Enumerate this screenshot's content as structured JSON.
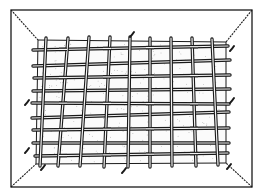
{
  "illustration": {
    "subject": "box-frame-with-woven-sticks",
    "colors": {
      "background": "#ffffff",
      "ink": "#1a1a1a",
      "stick_fill": "#f4f4f4",
      "speckle": "#9a9a9a"
    },
    "outer_frame": {
      "x1": 11,
      "y1": 10,
      "x2": 252,
      "y2": 187
    },
    "inner_frame": {
      "tl": [
        38,
        40
      ],
      "tr": [
        226,
        42
      ],
      "br": [
        226,
        163
      ],
      "bl": [
        36,
        164
      ]
    },
    "vertical_sticks": [
      {
        "top": [
          46,
          38
        ],
        "bottom": [
          40,
          166
        ]
      },
      {
        "top": [
          68,
          38
        ],
        "bottom": [
          58,
          166
        ]
      },
      {
        "top": [
          89,
          37
        ],
        "bottom": [
          80,
          166
        ]
      },
      {
        "top": [
          110,
          37
        ],
        "bottom": [
          104,
          167
        ]
      },
      {
        "top": [
          130,
          37
        ],
        "bottom": [
          128,
          167
        ]
      },
      {
        "top": [
          150,
          38
        ],
        "bottom": [
          150,
          167
        ]
      },
      {
        "top": [
          171,
          38
        ],
        "bottom": [
          172,
          166
        ]
      },
      {
        "top": [
          192,
          38
        ],
        "bottom": [
          196,
          166
        ]
      },
      {
        "top": [
          212,
          39
        ],
        "bottom": [
          218,
          165
        ]
      }
    ],
    "horizontal_sticks": [
      {
        "left": [
          33,
          50
        ],
        "right": [
          228,
          46
        ]
      },
      {
        "left": [
          33,
          66
        ],
        "right": [
          230,
          60
        ]
      },
      {
        "left": [
          34,
          78
        ],
        "right": [
          230,
          75
        ]
      },
      {
        "left": [
          33,
          91
        ],
        "right": [
          230,
          89
        ]
      },
      {
        "left": [
          32,
          103
        ],
        "right": [
          229,
          104
        ]
      },
      {
        "left": [
          32,
          118
        ],
        "right": [
          229,
          112
        ]
      },
      {
        "left": [
          33,
          130
        ],
        "right": [
          229,
          128
        ]
      },
      {
        "left": [
          33,
          143
        ],
        "right": [
          229,
          143
        ]
      },
      {
        "left": [
          35,
          156
        ],
        "right": [
          228,
          153
        ]
      }
    ],
    "pegs": [
      [
        132,
        34
      ],
      [
        232,
        48
      ],
      [
        232,
        100
      ],
      [
        27,
        102
      ],
      [
        27,
        150
      ],
      [
        43,
        167
      ],
      [
        124,
        170
      ],
      [
        229,
        166
      ]
    ]
  }
}
